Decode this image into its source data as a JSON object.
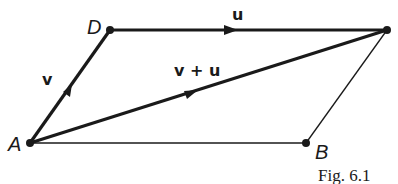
{
  "diagram": {
    "points": [
      {
        "id": "A",
        "label": "A"
      },
      {
        "id": "B",
        "label": "B"
      },
      {
        "id": "C",
        "label": ""
      },
      {
        "id": "D",
        "label": "D"
      }
    ],
    "vectors": [
      {
        "from": "A",
        "to": "D",
        "label": "v"
      },
      {
        "from": "D",
        "to": "C",
        "label": "u"
      },
      {
        "from": "A",
        "to": "C",
        "label": "v + u"
      }
    ],
    "plain_edges": [
      {
        "from": "A",
        "to": "B"
      },
      {
        "from": "B",
        "to": "C"
      }
    ],
    "caption": "Fig. 6.1"
  },
  "colors": {
    "ink": "#1a1a1a",
    "background": "#ffffff"
  }
}
